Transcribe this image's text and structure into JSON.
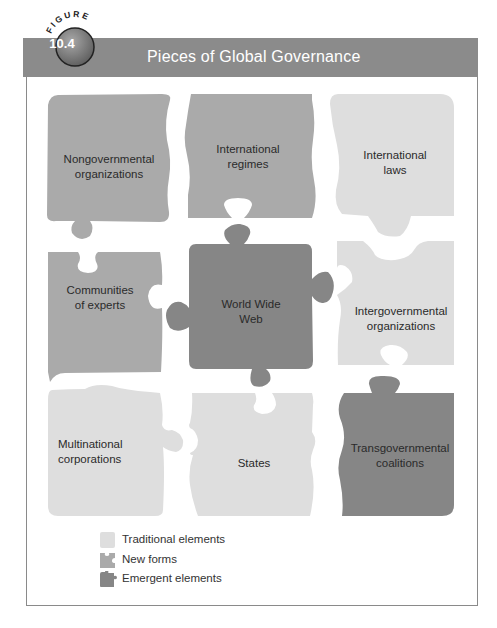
{
  "figure": {
    "badge_word": "FIGURE",
    "number": "10.4",
    "title": "Pieces of Global Governance"
  },
  "colors": {
    "title_bar": "#8b8b8b",
    "traditional": "#dedede",
    "new_forms": "#aaaaaa",
    "emergent": "#868686",
    "frame": "#8a8a8a"
  },
  "pieces": [
    {
      "id": "ngo",
      "label_lines": [
        "Nongovernmental",
        "organizations"
      ],
      "category": "new_forms"
    },
    {
      "id": "regimes",
      "label_lines": [
        "International",
        "regimes"
      ],
      "category": "new_forms"
    },
    {
      "id": "laws",
      "label_lines": [
        "International",
        "laws"
      ],
      "category": "traditional"
    },
    {
      "id": "experts",
      "label_lines": [
        "Communities",
        "of experts"
      ],
      "category": "new_forms"
    },
    {
      "id": "www",
      "label_lines": [
        "World Wide",
        "Web"
      ],
      "category": "emergent"
    },
    {
      "id": "igo",
      "label_lines": [
        "Intergovernmental",
        "organizations"
      ],
      "category": "traditional"
    },
    {
      "id": "mnc",
      "label_lines": [
        "Multinational",
        "corporations"
      ],
      "category": "traditional"
    },
    {
      "id": "states",
      "label_lines": [
        "States"
      ],
      "category": "traditional"
    },
    {
      "id": "tgc",
      "label_lines": [
        "Transgovernmental",
        "coalitions"
      ],
      "category": "emergent"
    }
  ],
  "labels": {
    "ngo": {
      "l1": "Nongovernmental",
      "l2": "organizations"
    },
    "regimes": {
      "l1": "International",
      "l2": "regimes"
    },
    "laws": {
      "l1": "International",
      "l2": "laws"
    },
    "experts": {
      "l1": "Communities",
      "l2": "of experts"
    },
    "www": {
      "l1": "World Wide",
      "l2": "Web"
    },
    "igo": {
      "l1": "Intergovernmental",
      "l2": "organizations"
    },
    "mnc": {
      "l1": "Multinational",
      "l2": "corporations"
    },
    "states": {
      "l1": "States"
    },
    "tgc": {
      "l1": "Transgovernmental",
      "l2": "coalitions"
    }
  },
  "legend": [
    {
      "label": "Traditional elements",
      "category": "traditional"
    },
    {
      "label": "New forms",
      "category": "new_forms"
    },
    {
      "label": "Emergent elements",
      "category": "emergent"
    }
  ]
}
